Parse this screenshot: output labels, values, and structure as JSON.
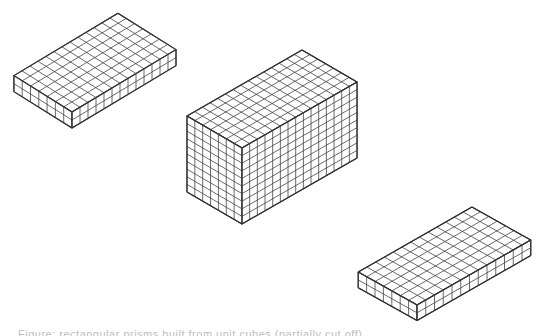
{
  "figure": {
    "stroke_color": "#333333",
    "background": "#ffffff",
    "prisms": [
      {
        "name": "flat-prism-top-left",
        "front_top": [
          72,
          112
        ],
        "left_dir_cells": 7,
        "right_dir_cells": 13,
        "height_cells": 2,
        "left_vector": [
          -8.3,
          -5.2
        ],
        "right_vector": [
          8.0,
          -4.8
        ],
        "up_vector": [
          0,
          -8.0
        ]
      },
      {
        "name": "tall-prism-center",
        "front_top": [
          242,
          148
        ],
        "left_dir_cells": 7,
        "right_dir_cells": 15,
        "height_cells": 10,
        "left_vector": [
          -7.86,
          -4.57
        ],
        "right_vector": [
          7.67,
          -4.4
        ],
        "up_vector": [
          0,
          -7.6
        ]
      },
      {
        "name": "flat-prism-bottom-right",
        "front_top": [
          417,
          305
        ],
        "left_dir_cells": 7,
        "right_dir_cells": 13,
        "height_cells": 2,
        "left_vector": [
          -8.4,
          -4.7
        ],
        "right_vector": [
          8.75,
          -5.0
        ],
        "up_vector": [
          0,
          -7.8
        ]
      }
    ]
  },
  "caption": {
    "text": "Figure: rectangular prisms built from unit cubes (partially cut off)"
  }
}
